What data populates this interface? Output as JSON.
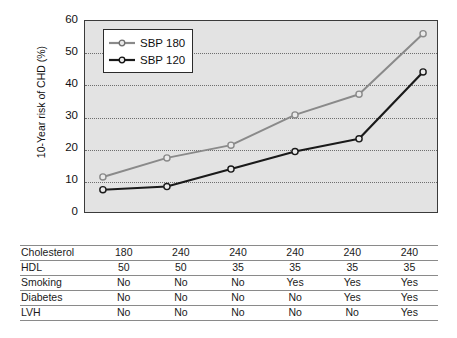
{
  "chart_data": {
    "type": "line",
    "title": "",
    "xlabel": "",
    "ylabel": "10-Year risk of CHD (%)",
    "ylim": [
      0,
      60
    ],
    "yticks": [
      0,
      10,
      20,
      30,
      40,
      50,
      60
    ],
    "grid": "horizontal-dotted",
    "legend_position": "top-left-inside",
    "x": [
      1,
      2,
      3,
      4,
      5,
      6
    ],
    "series": [
      {
        "name": "SBP 180",
        "color": "#8a8a8a",
        "marker": "open-circle",
        "values": [
          11,
          17,
          21,
          30.5,
          37,
          56
        ]
      },
      {
        "name": "SBP 120",
        "color": "#1a1a1a",
        "marker": "open-circle",
        "values": [
          7,
          8,
          13.5,
          19,
          23,
          44
        ]
      }
    ]
  },
  "legend": {
    "items": [
      {
        "label": "SBP 180",
        "color": "#8a8a8a"
      },
      {
        "label": "SBP 120",
        "color": "#1a1a1a"
      }
    ]
  },
  "axis": {
    "y_title": "10-Year risk of CHD (%)",
    "y_tick_labels": [
      "60",
      "50",
      "40",
      "30",
      "20",
      "10",
      "0"
    ]
  },
  "table": {
    "rows": [
      {
        "label": "Cholesterol",
        "cells": [
          "180",
          "240",
          "240",
          "240",
          "240",
          "240"
        ]
      },
      {
        "label": "HDL",
        "cells": [
          "50",
          "50",
          "35",
          "35",
          "35",
          "35"
        ]
      },
      {
        "label": "Smoking",
        "cells": [
          "No",
          "No",
          "No",
          "Yes",
          "Yes",
          "Yes"
        ]
      },
      {
        "label": "Diabetes",
        "cells": [
          "No",
          "No",
          "No",
          "No",
          "Yes",
          "Yes"
        ]
      },
      {
        "label": "LVH",
        "cells": [
          "No",
          "No",
          "No",
          "No",
          "No",
          "Yes"
        ]
      }
    ]
  },
  "colors": {
    "plot_background": "#e3e3e3",
    "plot_border": "#3b3b3b",
    "gridline": "#6e6e6e",
    "series_high": "#8a8a8a",
    "series_low": "#1a1a1a"
  }
}
